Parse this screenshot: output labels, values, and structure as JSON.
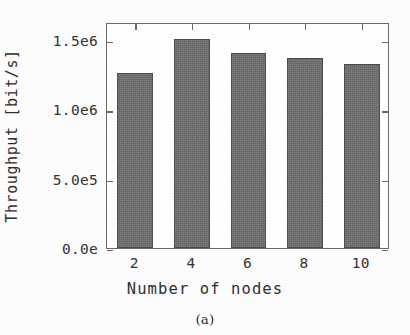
{
  "chart_data": {
    "type": "bar",
    "title": "",
    "subtitle": "",
    "xlabel": "Number of nodes",
    "ylabel": "Throughput [bit/s]",
    "caption": "(a)",
    "categories": [
      "2",
      "4",
      "6",
      "8",
      "10"
    ],
    "values": [
      1260000,
      1510000,
      1410000,
      1370000,
      1330000
    ],
    "series": [
      {
        "name": "Throughput",
        "values": [
          1260000,
          1510000,
          1410000,
          1370000,
          1330000
        ]
      }
    ],
    "ylim": [
      0,
      1630000
    ],
    "ytick_values": [
      0,
      500000,
      1000000,
      1500000
    ],
    "ytick_labels": [
      "0.0e",
      "5.0e5",
      "1.0e6",
      "1.5e6"
    ],
    "xtick_labels": [
      "2",
      "4",
      "6",
      "8",
      "10"
    ],
    "grid": false,
    "legend": false,
    "legend_position": "none",
    "bar_color": "#70706f",
    "bar_edge_color": "#4c4c4c",
    "frame_color": "#6a6a6a",
    "background_color": "#ffffff"
  }
}
